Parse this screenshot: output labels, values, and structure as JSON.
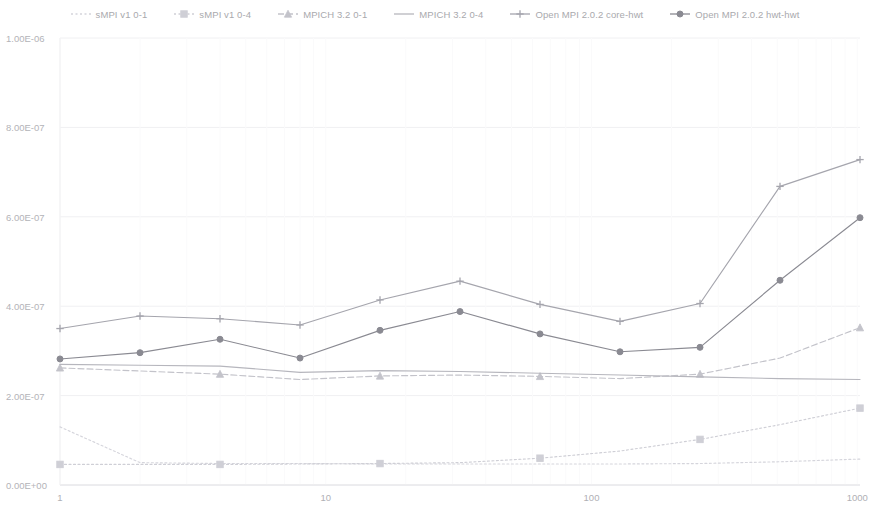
{
  "legend": {
    "position": "top-center",
    "items": [
      {
        "label": "sMPI v1 0-1",
        "color": "#d5d5dc",
        "marker": "none",
        "dash": "dotted"
      },
      {
        "label": "sMPI v1 0-4",
        "color": "#cfcfd6",
        "marker": "square",
        "dash": "dotted"
      },
      {
        "label": "MPICH 3.2 0-1",
        "color": "#c3c3ca",
        "marker": "triangle",
        "dash": "dashed"
      },
      {
        "label": "MPICH 3.2 0-4",
        "color": "#b6b6bd",
        "marker": "none",
        "dash": "solid"
      },
      {
        "label": "Open MPI 2.0.2 core-hwt",
        "color": "#a5a5ad",
        "marker": "cross",
        "dash": "solid"
      },
      {
        "label": "Open MPI 2.0.2 hwt-hwt",
        "color": "#8a8a92",
        "marker": "circle",
        "dash": "solid"
      }
    ]
  },
  "axes": {
    "x": {
      "scale": "log",
      "label": "",
      "ticks": [
        "1",
        "10",
        "100",
        "1000"
      ],
      "tick_values": [
        1,
        10,
        100,
        1000
      ],
      "min": 1,
      "max": 1024
    },
    "y": {
      "scale": "linear",
      "label": "",
      "ticks": [
        "0.00E+00",
        "2.00E-07",
        "4.00E-07",
        "6.00E-07",
        "8.00E-07",
        "1.00E-06"
      ],
      "tick_values": [
        0,
        2e-07,
        4e-07,
        6e-07,
        8e-07,
        1e-06
      ],
      "min": 0,
      "max": 1e-06
    },
    "grid": "faint-horizontal"
  },
  "chart_data": {
    "type": "line",
    "title": "",
    "xlabel": "",
    "ylabel": "",
    "xscale": "log",
    "xlim": [
      1,
      1024
    ],
    "ylim": [
      0,
      1e-06
    ],
    "x": [
      1,
      2,
      4,
      8,
      16,
      32,
      64,
      128,
      256,
      512,
      1024
    ],
    "legend_position": "top-center",
    "grid": true,
    "series": [
      {
        "name": "sMPI v1 0-1",
        "color": "#d5d5dc",
        "marker": "none",
        "dash": "dotted",
        "values": [
          1.3e-07,
          5e-08,
          4.8e-08,
          4.8e-08,
          4.7e-08,
          4.7e-08,
          4.7e-08,
          4.7e-08,
          4.8e-08,
          5.2e-08,
          5.8e-08
        ]
      },
      {
        "name": "sMPI v1 0-4",
        "color": "#cfcfd6",
        "marker": "square",
        "dash": "dotted",
        "values": [
          4.6e-08,
          4.6e-08,
          4.6e-08,
          4.7e-08,
          4.8e-08,
          5e-08,
          6e-08,
          7.6e-08,
          1.02e-07,
          1.35e-07,
          1.72e-07
        ]
      },
      {
        "name": "MPICH 3.2 0-1",
        "color": "#c3c3ca",
        "marker": "triangle",
        "dash": "dashed",
        "values": [
          2.62e-07,
          2.55e-07,
          2.48e-07,
          2.36e-07,
          2.44e-07,
          2.46e-07,
          2.43e-07,
          2.38e-07,
          2.48e-07,
          2.84e-07,
          3.52e-07
        ]
      },
      {
        "name": "MPICH 3.2 0-4",
        "color": "#b6b6bd",
        "marker": "none",
        "dash": "solid",
        "values": [
          2.7e-07,
          2.68e-07,
          2.66e-07,
          2.52e-07,
          2.56e-07,
          2.54e-07,
          2.5e-07,
          2.46e-07,
          2.42e-07,
          2.38e-07,
          2.36e-07
        ]
      },
      {
        "name": "Open MPI 2.0.2 core-hwt",
        "color": "#a5a5ad",
        "marker": "cross",
        "dash": "solid",
        "values": [
          3.5e-07,
          3.78e-07,
          3.72e-07,
          3.58e-07,
          4.14e-07,
          4.56e-07,
          4.04e-07,
          3.66e-07,
          4.06e-07,
          6.68e-07,
          7.28e-07
        ]
      },
      {
        "name": "Open MPI 2.0.2 hwt-hwt",
        "color": "#8a8a92",
        "marker": "circle",
        "dash": "solid",
        "values": [
          2.82e-07,
          2.96e-07,
          3.26e-07,
          2.84e-07,
          3.46e-07,
          3.88e-07,
          3.38e-07,
          2.98e-07,
          3.08e-07,
          4.58e-07,
          5.98e-07
        ]
      }
    ]
  }
}
